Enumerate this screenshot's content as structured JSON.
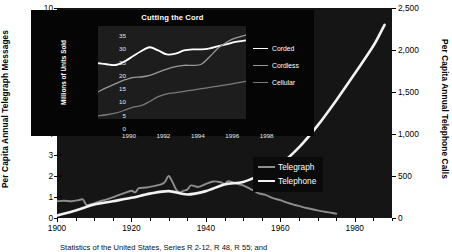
{
  "chart_data": [
    {
      "type": "line",
      "id": "main",
      "title": "",
      "xlabel": "",
      "ylabel": "Per Capita Annual Telegraph Messages",
      "y2label": "Per Capita Annual Telephone Calls",
      "xlim": [
        1900,
        1990
      ],
      "ylim": [
        0,
        10
      ],
      "y2lim": [
        0,
        2500
      ],
      "grid": false,
      "legend_position": "inside-right",
      "xticks": [
        "1900",
        "1920",
        "1940",
        "1960",
        "1980"
      ],
      "xtick_values": [
        1900,
        1920,
        1940,
        1960,
        1980
      ],
      "xminor_step": 5,
      "yticks": [
        "0",
        "1",
        "2",
        "3",
        "4",
        "5",
        "6",
        "7",
        "8",
        "9",
        "10"
      ],
      "ytick_values": [
        0,
        1,
        2,
        3,
        4,
        5,
        6,
        7,
        8,
        9,
        10
      ],
      "y2ticks": [
        "0",
        "500",
        "1,000",
        "1,500",
        "2,000",
        "2,500"
      ],
      "y2tick_values": [
        0,
        500,
        1000,
        1500,
        2000,
        2500
      ],
      "series": [
        {
          "name": "Telegraph",
          "color": "#8e8e8e",
          "axis": "left",
          "x": [
            1900,
            1902,
            1904,
            1906,
            1907,
            1908,
            1910,
            1912,
            1914,
            1916,
            1918,
            1920,
            1921,
            1922,
            1924,
            1926,
            1928,
            1929,
            1930,
            1931,
            1932,
            1933,
            1934,
            1935,
            1936,
            1938,
            1940,
            1942,
            1944,
            1945,
            1946,
            1948,
            1950,
            1952,
            1953,
            1954,
            1956,
            1958,
            1960,
            1962,
            1964,
            1966,
            1968,
            1970,
            1972,
            1974,
            1975
          ],
          "y": [
            0.8,
            0.82,
            0.8,
            0.86,
            0.88,
            0.62,
            0.7,
            0.82,
            0.92,
            1.05,
            1.18,
            1.3,
            1.22,
            1.42,
            1.45,
            1.52,
            1.6,
            1.72,
            2.0,
            1.72,
            1.36,
            1.22,
            1.3,
            1.35,
            1.55,
            1.48,
            1.62,
            1.74,
            1.7,
            1.62,
            1.75,
            1.65,
            1.55,
            1.38,
            1.3,
            1.18,
            1.1,
            0.95,
            0.85,
            0.72,
            0.62,
            0.52,
            0.44,
            0.36,
            0.3,
            0.24,
            0.2
          ]
        },
        {
          "name": "Telephone",
          "color": "#f2f2f2",
          "axis": "right",
          "x": [
            1900,
            1905,
            1910,
            1915,
            1920,
            1925,
            1930,
            1935,
            1940,
            1945,
            1950,
            1955,
            1960,
            1965,
            1970,
            1975,
            1980,
            1985,
            1988
          ],
          "y": [
            30,
            90,
            160,
            200,
            240,
            290,
            320,
            280,
            320,
            400,
            430,
            520,
            640,
            840,
            1100,
            1400,
            1720,
            2050,
            2300
          ]
        }
      ]
    },
    {
      "type": "line",
      "id": "inset",
      "title": "Cutting the Cord",
      "xlabel": "",
      "ylabel": "Millions of Units Sold",
      "xlim": [
        1990,
        1998.6
      ],
      "ylim": [
        0,
        35
      ],
      "grid": false,
      "legend_position": "right",
      "xticks": [
        "1990",
        "1992",
        "1994",
        "1996",
        "1998"
      ],
      "xtick_values": [
        1990,
        1992,
        1994,
        1996,
        1998
      ],
      "yticks": [
        "0",
        "5",
        "10",
        "15",
        "20",
        "25",
        "30",
        "35"
      ],
      "ytick_values": [
        0,
        5,
        10,
        15,
        20,
        25,
        30,
        35
      ],
      "series": [
        {
          "name": "Corded",
          "color": "#ffffff",
          "x": [
            1990,
            1990.5,
            1991,
            1991.5,
            1992,
            1992.5,
            1993,
            1993.5,
            1994,
            1994.5,
            1995,
            1995.5,
            1996,
            1996.5,
            1997,
            1997.5,
            1998,
            1998.6
          ],
          "y": [
            21.0,
            20.6,
            20.3,
            21.5,
            23.5,
            25.5,
            27.0,
            25.8,
            24.3,
            24.6,
            25.8,
            26.2,
            26.2,
            26.6,
            27.4,
            28.2,
            29.0,
            29.6
          ]
        },
        {
          "name": "Cordless",
          "color": "#999999",
          "x": [
            1990,
            1990.5,
            1991,
            1991.5,
            1992,
            1992.5,
            1993,
            1993.5,
            1994,
            1994.5,
            1995,
            1995.5,
            1996,
            1996.5,
            1997,
            1997.5,
            1998,
            1998.6
          ],
          "y": [
            10.2,
            11.8,
            13.2,
            14.6,
            15.6,
            15.8,
            16.4,
            17.6,
            18.8,
            19.7,
            20.2,
            20.2,
            20.6,
            23.5,
            26.8,
            29.0,
            30.5,
            31.6
          ]
        },
        {
          "name": "Cellular",
          "color": "#7a7a7a",
          "x": [
            1990,
            1990.5,
            1991,
            1991.5,
            1992,
            1992.5,
            1993,
            1993.5,
            1994,
            1994.5,
            1995,
            1995.5,
            1996,
            1996.5,
            1997,
            1997.5,
            1998,
            1998.6
          ],
          "y": [
            1.2,
            1.6,
            2.2,
            3.2,
            4.4,
            5.0,
            6.6,
            8.4,
            9.5,
            9.9,
            10.4,
            10.9,
            11.4,
            11.9,
            12.4,
            12.9,
            13.5,
            14.2
          ]
        }
      ]
    }
  ],
  "main": {
    "axis_left_title": "Per Capita Annual Telegraph Messages",
    "axis_right_title": "Per Capita Annual Telephone Calls",
    "legend": [
      {
        "label": "Telegraph",
        "color": "#8e8e8e"
      },
      {
        "label": "Telephone",
        "color": "#f2f2f2"
      }
    ]
  },
  "inset": {
    "title": "Cutting the Cord",
    "axis_y_title": "Millions of Units Sold",
    "legend": [
      {
        "label": "Corded",
        "color": "#ffffff"
      },
      {
        "label": "Cordless",
        "color": "#999999"
      },
      {
        "label": "Cellular",
        "color": "#7a7a7a"
      }
    ]
  },
  "caption": {
    "text": "Statistics of the United States, Series R 2-12, R 48, R 55; and"
  },
  "colors": {
    "plot_background": "#151515",
    "inset_background": "#050505",
    "inset_plot_background": "#1d1d1d",
    "page_background": "#ffffff",
    "axis_text": "#000000"
  }
}
